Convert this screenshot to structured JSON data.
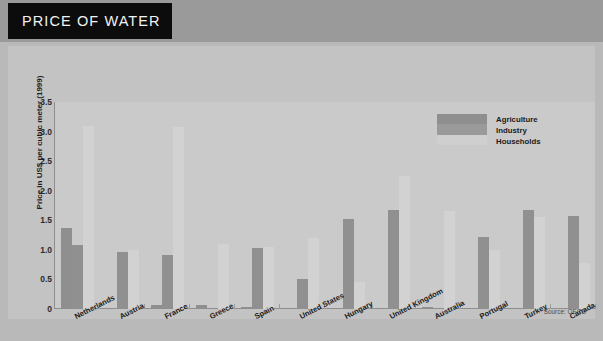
{
  "header": {
    "title": "PRICE OF WATER"
  },
  "source": "Source: OECD",
  "legend": {
    "items": [
      {
        "label": "Agriculture",
        "color": "#8f8f8f"
      },
      {
        "label": "Industry",
        "color": "#9a9a9a"
      },
      {
        "label": "Households",
        "color": "#cfcfcf"
      }
    ]
  },
  "chart_data": {
    "type": "bar",
    "title": "PRICE OF WATER",
    "xlabel": "",
    "ylabel": "Price in US$ per cubic meter (1999)",
    "ylim": [
      0,
      3.5
    ],
    "yticks": [
      "0",
      "0.5",
      "1.0",
      "1.5",
      "2.0",
      "2.5",
      "3.0",
      "3.5"
    ],
    "ytick_values": [
      0,
      0.5,
      1.0,
      1.5,
      2.0,
      2.5,
      3.0,
      3.5
    ],
    "grid": false,
    "legend_position": "top-right",
    "categories": [
      "Netherlands",
      "Austria",
      "France",
      "Greece",
      "Spain",
      "United States",
      "Hungary",
      "United Kingdom",
      "Australia",
      "Portugal",
      "Turkey",
      "Canada"
    ],
    "series": [
      {
        "name": "Agriculture",
        "color": "#8f8f8f",
        "values": [
          1.37,
          0,
          0.07,
          0.06,
          0.03,
          0,
          0,
          0,
          0.04,
          0,
          0,
          0
        ]
      },
      {
        "name": "Industry",
        "color": "#909090",
        "values": [
          1.08,
          0.97,
          0.92,
          0,
          1.04,
          0.5,
          1.52,
          1.67,
          0,
          1.22,
          1.68,
          1.58
        ]
      },
      {
        "name": "Households",
        "color": "#d2d2d2",
        "values": [
          3.1,
          1.0,
          3.07,
          1.1,
          1.05,
          1.2,
          0.45,
          2.25,
          1.65,
          1.0,
          1.55,
          0.78
        ]
      }
    ]
  }
}
